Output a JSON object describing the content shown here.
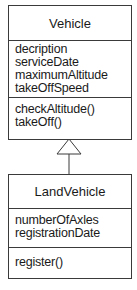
{
  "classes": [
    {
      "name": "Vehicle",
      "attributes": [
        "decription",
        "serviceDate",
        "maximumAltitude",
        "takeOffSpeed"
      ],
      "operations": [
        "checkAltitude()",
        "takeOff()"
      ]
    },
    {
      "name": "LandVehicle",
      "attributes": [
        "numberOfAxles",
        "registrationDate"
      ],
      "operations": [
        "register()"
      ]
    }
  ],
  "relationships": [
    {
      "type": "generalization",
      "from": "LandVehicle",
      "to": "Vehicle"
    }
  ]
}
